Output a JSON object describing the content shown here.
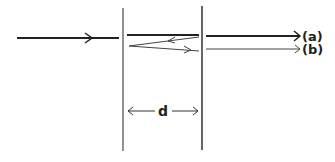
{
  "diagram": {
    "type": "thin-film / parallel-slab multiple reflection",
    "labels": {
      "ray_a": "(a)",
      "ray_b": "(b)",
      "thickness": "d"
    },
    "colors": {
      "line": "#222222",
      "thin_line": "#444444",
      "background": "#ffffff"
    },
    "elements": {
      "incident_ray": {
        "from": [
          17,
          38
        ],
        "to": [
          119,
          38
        ],
        "arrow_at": 90
      },
      "left_boundary": {
        "x": 123,
        "y_top": 8,
        "y_bottom": 151
      },
      "right_boundary": {
        "x": 202,
        "y_top": 6,
        "y_bottom": 150
      },
      "transmitted_in_slab": {
        "from": [
          127,
          35
        ],
        "to": [
          199,
          35
        ]
      },
      "reflected_back": {
        "from": [
          199,
          37
        ],
        "to": [
          129,
          46
        ]
      },
      "reflected_forward": {
        "from": [
          129,
          46
        ],
        "to": [
          199,
          51
        ]
      },
      "output_ray_a": {
        "from": [
          206,
          36
        ],
        "to": [
          300,
          36
        ]
      },
      "output_ray_b": {
        "from": [
          206,
          49
        ],
        "to": [
          300,
          49
        ]
      },
      "dimension_arrow": {
        "y": 111,
        "x_left": 128,
        "x_right": 198
      }
    }
  }
}
